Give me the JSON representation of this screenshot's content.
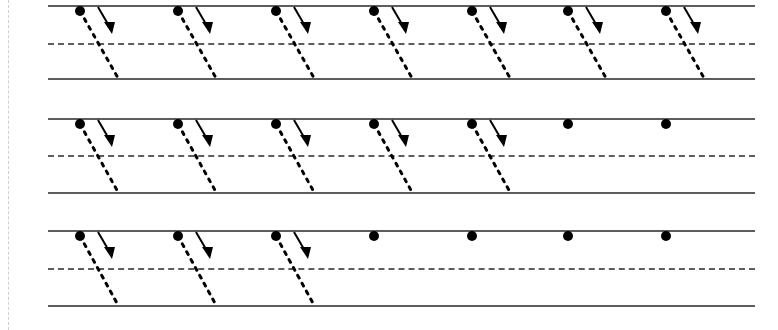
{
  "worksheet": {
    "title": "Slanted Stroke Handwriting Practice Worksheet",
    "description": "Three ruled handwriting rows with dotted slanted stroke guides, starting dots and directional arrows, fading progressively from left to right.",
    "page_width": 778,
    "page_height": 330,
    "background_color": "#ffffff",
    "ink_color": "#000000",
    "rule_color": "#5d5d5d",
    "margin_color": "#cfcfcf"
  },
  "margin_rule": {
    "name": "left-margin-rule",
    "x": 8,
    "style": "dashed",
    "color": "#cfcfcf"
  },
  "layout": {
    "line_start_x": 48,
    "line_end_x": 755,
    "dot_positions_x": [
      80,
      178,
      276,
      374,
      472,
      568,
      666
    ],
    "dot_radius": 5,
    "stroke_style": "dotted",
    "stroke_width": 3,
    "stroke_slant_dx": 38,
    "arrow_color": "#000000"
  },
  "rows": [
    {
      "name": "practice-row-1",
      "index": 1,
      "top_y": 5,
      "mid_y": 43,
      "base_y": 78,
      "guided_count": 7,
      "dot_count": 7,
      "label": "Row 1 — seven guided strokes"
    },
    {
      "name": "practice-row-2",
      "index": 2,
      "top_y": 118,
      "mid_y": 155,
      "base_y": 192,
      "guided_count": 5,
      "dot_count": 7,
      "label": "Row 2 — five guided strokes, two start dots only"
    },
    {
      "name": "practice-row-3",
      "index": 3,
      "top_y": 230,
      "mid_y": 268,
      "base_y": 305,
      "guided_count": 3,
      "dot_count": 7,
      "label": "Row 3 — three guided strokes, four start dots only"
    }
  ]
}
